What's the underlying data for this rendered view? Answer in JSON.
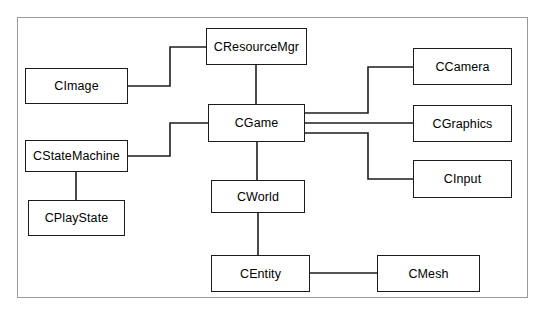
{
  "diagram": {
    "type": "class-relationship-diagram",
    "border_color": "#9a9a9a",
    "line_color": "#1c1c1c",
    "box_fill": "#ffffff",
    "nodes": [
      {
        "id": "cresourcemgr",
        "label": "CResourceMgr",
        "x": 206,
        "y": 28,
        "w": 101,
        "h": 37
      },
      {
        "id": "cimage",
        "label": "CImage",
        "x": 25,
        "y": 68,
        "w": 103,
        "h": 36
      },
      {
        "id": "cgame",
        "label": "CGame",
        "x": 208,
        "y": 104,
        "w": 97,
        "h": 38
      },
      {
        "id": "ccamera",
        "label": "CCamera",
        "x": 413,
        "y": 48,
        "w": 99,
        "h": 37
      },
      {
        "id": "cgraphics",
        "label": "CGraphics",
        "x": 413,
        "y": 105,
        "w": 99,
        "h": 37
      },
      {
        "id": "cinput",
        "label": "CInput",
        "x": 413,
        "y": 160,
        "w": 99,
        "h": 38
      },
      {
        "id": "cstatemachine",
        "label": "CStateMachine",
        "x": 25,
        "y": 140,
        "w": 103,
        "h": 32
      },
      {
        "id": "cplaystate",
        "label": "CPlayState",
        "x": 28,
        "y": 200,
        "w": 97,
        "h": 36
      },
      {
        "id": "cworld",
        "label": "CWorld",
        "x": 211,
        "y": 180,
        "w": 94,
        "h": 33
      },
      {
        "id": "centity",
        "label": "CEntity",
        "x": 211,
        "y": 255,
        "w": 99,
        "h": 37
      },
      {
        "id": "cmesh",
        "label": "CMesh",
        "x": 377,
        "y": 255,
        "w": 103,
        "h": 37
      }
    ],
    "connections": [
      {
        "id": "cimage-cresourcemgr",
        "from": "cimage",
        "to": "cresourcemgr",
        "path": "M128,86 L170,86 L170,47 L206,47"
      },
      {
        "id": "cresourcemgr-cgame",
        "from": "cresourcemgr",
        "to": "cgame",
        "path": "M256,65 L256,104"
      },
      {
        "id": "cstatemachine-cgame",
        "from": "cstatemachine",
        "to": "cgame",
        "path": "M128,156 L170,156 L170,123 L208,123"
      },
      {
        "id": "cstatemachine-cplaystate",
        "from": "cstatemachine",
        "to": "cplaystate",
        "path": "M76,172 L76,200"
      },
      {
        "id": "cgame-ccamera",
        "from": "cgame",
        "to": "ccamera",
        "path": "M305,113 L368,113 L368,67 L413,67"
      },
      {
        "id": "cgame-cgraphics",
        "from": "cgame",
        "to": "cgraphics",
        "path": "M305,123 L413,123"
      },
      {
        "id": "cgame-cinput",
        "from": "cgame",
        "to": "cinput",
        "path": "M305,133 L368,133 L368,179 L413,179"
      },
      {
        "id": "cgame-cworld",
        "from": "cgame",
        "to": "cworld",
        "path": "M257,142 L257,180"
      },
      {
        "id": "cworld-centity",
        "from": "cworld",
        "to": "centity",
        "path": "M258,213 L258,255"
      },
      {
        "id": "centity-cmesh",
        "from": "centity",
        "to": "cmesh",
        "path": "M310,273 L377,273"
      }
    ]
  }
}
